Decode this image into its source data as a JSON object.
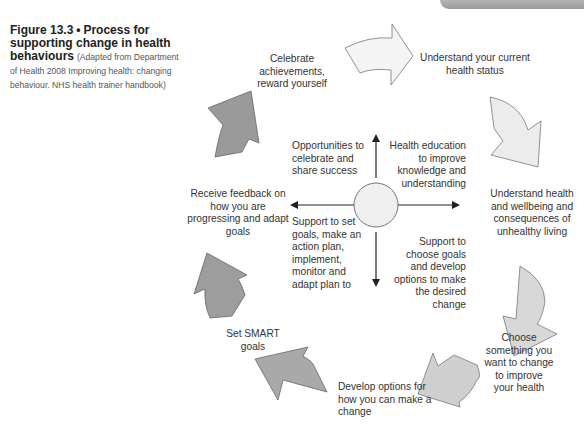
{
  "figure": {
    "number": "Figure 13.3",
    "separator": "•",
    "title": "Process for supporting change in health behaviours",
    "source": "(Adapted from Department of Health 2008 Improving health: changing behaviour. NHS health trainer handbook)"
  },
  "cycle_steps": [
    {
      "id": 1,
      "label": "Understand your current health status"
    },
    {
      "id": 2,
      "label": "Understand health and wellbeing and consequences of unhealthy living"
    },
    {
      "id": 3,
      "label": "Choose something you want to change to improve your health"
    },
    {
      "id": 4,
      "label": "Develop options for how you can make a change"
    },
    {
      "id": 5,
      "label": "Set SMART goals"
    },
    {
      "id": 6,
      "label": "Receive feedback on how you are progressing and adapt goals"
    },
    {
      "id": 7,
      "label": "Celebrate achievements, reward yourself"
    }
  ],
  "quadrants": {
    "top_left": "Opportunities to celebrate and share success",
    "top_right": "Health education to improve knowledge and understanding",
    "bottom_left": "Support to set goals, make an action plan, implement, monitor and adapt plan to",
    "bottom_right": "Support to choose goals and develop options to make the desired change"
  },
  "colors": {
    "arrow_light": "#f2f2f2",
    "arrow_mid": "#d6d6d6",
    "arrow_dark": "#9c9c9c",
    "circle_fill": "#efefef",
    "stroke": "#555555"
  }
}
